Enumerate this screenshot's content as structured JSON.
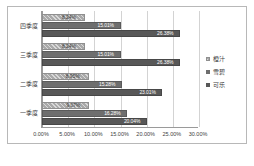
{
  "chart_data": {
    "type": "bar",
    "orientation": "horizontal",
    "title": "",
    "xlabel": "",
    "ylabel": "",
    "xlim": [
      0,
      0.3
    ],
    "grid": true,
    "legend_position": "right",
    "categories": [
      "一季度",
      "二季度",
      "三季度",
      "四季度"
    ],
    "categories_top_to_bottom": [
      "四季度",
      "三季度",
      "二季度",
      "一季度"
    ],
    "tick_labels": [
      "0.00%",
      "5.00%",
      "10.00%",
      "15.00%",
      "20.00%",
      "25.00%",
      "30.00%"
    ],
    "tick_values": [
      0,
      5,
      10,
      15,
      20,
      25,
      30
    ],
    "series": [
      {
        "name": "橙汁",
        "color": "#a9a9a9",
        "values": [
          9.07,
          8.95,
          8.24,
          8.24
        ],
        "labels": [
          "9.07%",
          "8.95%",
          "8.24%",
          "8.24%"
        ]
      },
      {
        "name": "雪碧",
        "color": "#6e6e6e",
        "values": [
          16.28,
          15.28,
          15.01,
          15.01
        ],
        "labels": [
          "16.28%",
          "15.28%",
          "15.01%",
          "15.01%"
        ]
      },
      {
        "name": "可乐",
        "color": "#585858",
        "values": [
          20.04,
          23.01,
          26.38,
          26.38
        ],
        "labels": [
          "20.04%",
          "23.01%",
          "26.38%",
          "26.38%"
        ]
      }
    ]
  },
  "legend": {
    "items": [
      {
        "label": "橙汁"
      },
      {
        "label": "雪碧"
      },
      {
        "label": "可乐"
      }
    ]
  }
}
